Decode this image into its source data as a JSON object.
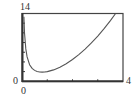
{
  "chart_data": {
    "type": "line",
    "title": "",
    "xlabel": "",
    "ylabel": "",
    "xlim": [
      0,
      4
    ],
    "ylim": [
      0,
      14
    ],
    "grid": false,
    "legend": null,
    "x_tick_marks": [
      1,
      2,
      3
    ],
    "y_tick_marks": [
      2,
      4,
      6,
      8,
      10,
      12
    ],
    "axis_labels": {
      "y_max": "14",
      "y_min": "0",
      "x_min": "0",
      "x_max": "4"
    },
    "series": [
      {
        "name": "f(x)",
        "function": "x^2 + 1/x",
        "x": [
          0.075,
          0.1,
          0.15,
          0.2,
          0.3,
          0.4,
          0.5,
          0.6,
          0.7,
          0.8,
          0.9,
          1.0,
          1.25,
          1.5,
          1.75,
          2.0,
          2.25,
          2.5,
          2.75,
          3.0,
          3.25,
          3.5,
          3.7
        ],
        "y": [
          13.34,
          10.01,
          6.69,
          5.04,
          3.42,
          2.66,
          2.25,
          2.03,
          1.92,
          1.89,
          1.92,
          2.0,
          2.36,
          2.92,
          3.63,
          4.5,
          5.51,
          6.65,
          7.93,
          9.33,
          10.87,
          12.54,
          13.96
        ]
      }
    ],
    "colors": {
      "curve": "#555555",
      "frame": "#444444",
      "background": "#ffffff"
    }
  }
}
